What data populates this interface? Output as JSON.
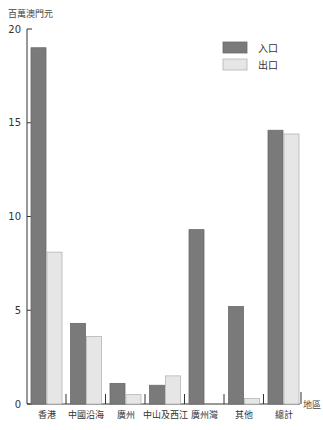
{
  "chart_data": {
    "type": "bar",
    "title": "",
    "ylabel": "百萬澳門元",
    "xlabel": "地區",
    "ylim": [
      0,
      20
    ],
    "yticks": [
      0,
      5,
      10,
      15,
      20
    ],
    "grid": false,
    "legend_position": "top-right",
    "categories": [
      "香港",
      "中國沿海",
      "廣州",
      "中山及西江",
      "廣州灣",
      "其他",
      "總計"
    ],
    "series": [
      {
        "name": "入口",
        "color": "#7a7a7a",
        "values": [
          19.0,
          4.3,
          1.1,
          1.0,
          9.3,
          5.2,
          14.6
        ]
      },
      {
        "name": "出口",
        "color": "#e6e6e6",
        "values": [
          8.1,
          3.6,
          0.5,
          1.5,
          0,
          0.3,
          14.4
        ]
      }
    ]
  }
}
